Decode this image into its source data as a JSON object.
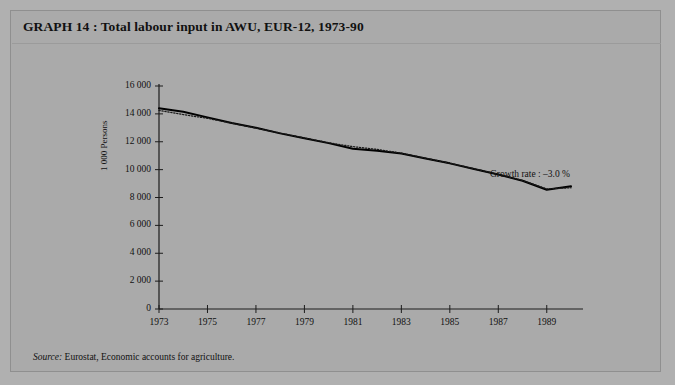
{
  "figure": {
    "label": "GRAPH 14",
    "title": "GRAPH 14 : Total labour input in AWU, EUR-12, 1973-90",
    "source_prefix": "Source:",
    "source_text": " Eurostat, Economic accounts for agriculture.",
    "annotation": "Growth rate : –3.0 %",
    "background_color": "#aaaaaa",
    "line_color": "#000000",
    "trend_color": "#1a1a1a"
  },
  "chart_data": {
    "type": "line",
    "title": "Total labour input in AWU, EUR-12, 1973-90",
    "xlabel": "",
    "ylabel": "1 000 Persons",
    "xlim": [
      1973,
      1990
    ],
    "ylim": [
      0,
      16000
    ],
    "ytick_values": [
      0,
      2000,
      4000,
      6000,
      8000,
      10000,
      12000,
      14000,
      16000
    ],
    "ytick_labels": [
      "0",
      "2 000",
      "4 000",
      "6 000",
      "8 000",
      "10 000",
      "12 000",
      "14 000",
      "16 000"
    ],
    "xtick_values": [
      1973,
      1975,
      1977,
      1979,
      1981,
      1983,
      1985,
      1987,
      1989
    ],
    "xtick_labels": [
      "1973",
      "1975",
      "1977",
      "1979",
      "1981",
      "1983",
      "1985",
      "1987",
      "1989"
    ],
    "grid": false,
    "legend": "none",
    "annotations": [
      {
        "text": "Growth rate : –3.0 %",
        "x": 1986.5,
        "y": 10300
      }
    ],
    "x": [
      1973,
      1974,
      1975,
      1976,
      1977,
      1978,
      1979,
      1980,
      1981,
      1982,
      1983,
      1984,
      1985,
      1986,
      1987,
      1988,
      1989,
      1990
    ],
    "series": [
      {
        "name": "Total labour input (AWU)",
        "style": "solid",
        "values": [
          14400,
          14150,
          13750,
          13350,
          13000,
          12600,
          12250,
          11900,
          11500,
          11350,
          11150,
          10800,
          10450,
          10050,
          9650,
          9200,
          8560,
          8800
        ]
      },
      {
        "name": "Trend",
        "style": "dotted",
        "values": [
          14250,
          13950,
          13680,
          13330,
          12980,
          12620,
          12270,
          11930,
          11650,
          11450,
          11180,
          10820,
          10460,
          10060,
          9660,
          9220,
          8620,
          8700
        ]
      }
    ]
  }
}
